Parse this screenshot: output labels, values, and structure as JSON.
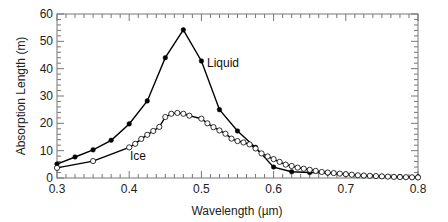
{
  "chart_data": {
    "type": "line",
    "title": "",
    "xlabel": "Wavelength (µm)",
    "ylabel": "Absorption Length (m)",
    "xlim": [
      0.3,
      0.8
    ],
    "ylim": [
      0,
      60
    ],
    "xticks": [
      0.3,
      0.4,
      0.5,
      0.6,
      0.7,
      0.8
    ],
    "xtick_labels": [
      "0.3",
      "0.4",
      "0.5",
      "0.6",
      "0.7",
      "0.8"
    ],
    "yticks": [
      0,
      10,
      20,
      30,
      40,
      50,
      60
    ],
    "ytick_labels": [
      "0",
      "10",
      "20",
      "30",
      "40",
      "50",
      "60"
    ],
    "grid": false,
    "legend": "inline labels",
    "series": [
      {
        "name": "Liquid",
        "marker": "filled-circle",
        "color": "#000000",
        "x": [
          0.3,
          0.325,
          0.35,
          0.375,
          0.4,
          0.425,
          0.45,
          0.475,
          0.5,
          0.525,
          0.55,
          0.575,
          0.6,
          0.625,
          0.65,
          0.675,
          0.7,
          0.725,
          0.75,
          0.775,
          0.8
        ],
        "y": [
          5.1,
          7.7,
          10.3,
          13.8,
          19.8,
          28.2,
          44.0,
          54.2,
          42.8,
          25.0,
          17.2,
          11.2,
          4.0,
          2.3,
          2.0,
          1.8,
          1.4,
          0.8,
          0.6,
          0.5,
          0.4
        ]
      },
      {
        "name": "Ice",
        "marker": "open-circle",
        "color": "#000000",
        "x": [
          0.3,
          0.35,
          0.4,
          0.4083,
          0.4167,
          0.425,
          0.4333,
          0.4417,
          0.45,
          0.4583,
          0.4667,
          0.475,
          0.4833,
          0.5,
          0.5083,
          0.5167,
          0.525,
          0.5333,
          0.5417,
          0.55,
          0.5583,
          0.5667,
          0.575,
          0.5833,
          0.5917,
          0.6,
          0.6083,
          0.6167,
          0.625,
          0.6333,
          0.6417,
          0.65,
          0.6583,
          0.6667,
          0.675,
          0.6833,
          0.6917,
          0.7,
          0.7083,
          0.7167,
          0.725,
          0.7333,
          0.7417,
          0.75,
          0.7583,
          0.7667,
          0.775,
          0.7833,
          0.7917,
          0.8
        ],
        "y": [
          3.7,
          6.2,
          11.2,
          12.5,
          14.3,
          15.8,
          17.2,
          18.7,
          22.3,
          23.5,
          23.8,
          23.5,
          22.8,
          21.7,
          20.0,
          18.6,
          17.4,
          16.2,
          14.4,
          13.5,
          13.0,
          12.3,
          10.8,
          9.0,
          7.9,
          6.9,
          5.9,
          4.9,
          4.4,
          3.8,
          3.4,
          3.0,
          2.6,
          2.2,
          2.0,
          1.8,
          1.6,
          1.4,
          1.2,
          1.0,
          0.9,
          0.8,
          0.7,
          0.6,
          0.5,
          0.4,
          0.35,
          0.3,
          0.25,
          0.2
        ]
      }
    ],
    "annotations": [
      {
        "text": "Liquid",
        "x": 0.505,
        "y": 41
      },
      {
        "text": "Ice",
        "x": 0.405,
        "y": 9
      }
    ]
  },
  "labels": {
    "xlabel": "Wavelength (µm)",
    "ylabel": "Absorption Length (m)",
    "liquid": "Liquid",
    "ice": "Ice"
  }
}
